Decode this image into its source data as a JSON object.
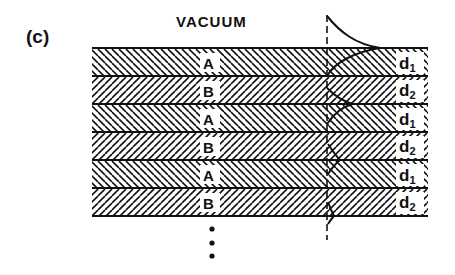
{
  "figure": {
    "panel_label": "(c)",
    "top_region_label": "VACUUM",
    "colors": {
      "ink": "#111111",
      "background": "#ffffff"
    }
  },
  "layers": [
    {
      "material": "A",
      "thickness_label": "d",
      "thickness_sub": "1",
      "hatch": "backslash"
    },
    {
      "material": "B",
      "thickness_label": "d",
      "thickness_sub": "2",
      "hatch": "slash"
    },
    {
      "material": "A",
      "thickness_label": "d",
      "thickness_sub": "1",
      "hatch": "backslash"
    },
    {
      "material": "B",
      "thickness_label": "d",
      "thickness_sub": "2",
      "hatch": "slash"
    },
    {
      "material": "A",
      "thickness_label": "d",
      "thickness_sub": "1",
      "hatch": "backslash"
    },
    {
      "material": "B",
      "thickness_label": "d",
      "thickness_sub": "2",
      "hatch": "slash"
    }
  ],
  "continuation": "⋮",
  "annotations": {
    "reference_line": "dashed vertical reference axis",
    "field_profile": "surface-localized mode amplitude decaying into vacuum and into the superlattice"
  }
}
